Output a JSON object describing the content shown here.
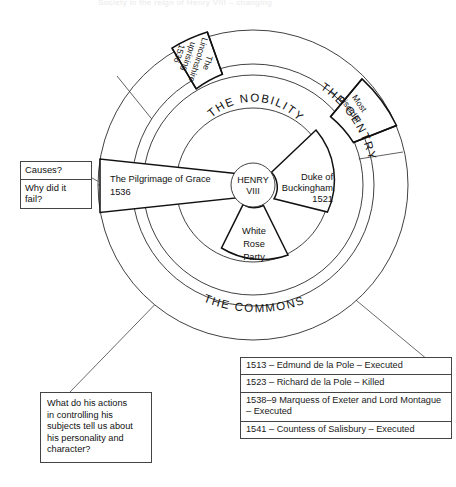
{
  "page": {
    "faint_cropped_header": "Society in the reign of Henry VIII – changing"
  },
  "diagram": {
    "type": "concentric-ring-diagram",
    "center": {
      "label_line1": "HENRY",
      "label_line2": "VIII"
    },
    "rings": [
      {
        "name": "nobility",
        "label": "THE  NOBILITY"
      },
      {
        "name": "gentry",
        "label": "THE GENTRY"
      },
      {
        "name": "commons",
        "label": "THE COMMONS"
      }
    ],
    "wedges": [
      {
        "id": "pilgrimage",
        "ring": "nobility-commons",
        "text_line1": "The Pilgrimage of Grace",
        "text_line2": "1536"
      },
      {
        "id": "buckingham",
        "ring": "nobility",
        "text_line1": "Duke of",
        "text_line2": "Buckingham",
        "text_line3": "1521"
      },
      {
        "id": "white-rose",
        "ring": "nobility",
        "text_line1": "White",
        "text_line2": "Rose",
        "text_line3": "Party"
      },
      {
        "id": "lincolnshire",
        "ring": "gentry",
        "text_line1": "The",
        "text_line2": "Lincolnshire",
        "text_line3": "uprising",
        "text_line4": "1536"
      },
      {
        "id": "most-disorder",
        "ring": "gentry",
        "text_line1": "Most",
        "text_line2": "disorder"
      }
    ]
  },
  "causes_box": {
    "title": "Causes?",
    "question_line1": "Why did it",
    "question_line2": "fail?"
  },
  "question_box": {
    "line1": "What do his actions",
    "line2": "in controlling his",
    "line3": "subjects tell us about",
    "line4": "his personality and",
    "line5": "character?"
  },
  "events_table": {
    "rows": [
      {
        "text": "1513 – Edmund de la Pole – Executed"
      },
      {
        "text": "1523 – Richard de la Pole – Killed"
      },
      {
        "text": "1538–9 Marquess of Exeter and Lord"
      },
      {
        "text": "Montague – Executed"
      },
      {
        "text": "1541 – Countess of Salisbury – Executed"
      }
    ],
    "row_groups": [
      "1513 – Edmund de la Pole – Executed",
      "1523 – Richard de la Pole – Killed",
      "1538–9 Marquess of Exeter and Lord Montague – Executed",
      "1541 – Countess of Salisbury – Executed"
    ]
  },
  "colors": {
    "stroke": "#2b2b2b",
    "strong_stroke": "#111111",
    "background": "#ffffff",
    "box_border": "#444444"
  }
}
